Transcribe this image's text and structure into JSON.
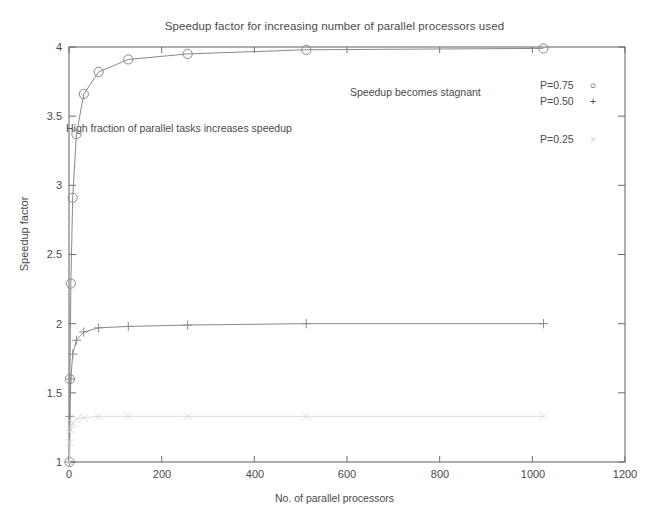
{
  "chart_data": {
    "type": "line",
    "title": "Speedup factor for increasing number of parallel processors used",
    "xlabel": "No. of parallel processors",
    "ylabel": "Speedup factor",
    "xlim": [
      0,
      1200
    ],
    "ylim": [
      1,
      4
    ],
    "xticks": [
      0,
      200,
      400,
      600,
      800,
      1000,
      1200
    ],
    "yticks": [
      1,
      1.5,
      2,
      2.5,
      3,
      3.5,
      4
    ],
    "xtick_labels": [
      "0",
      "200",
      "400",
      "600",
      "800",
      "1000",
      "1200"
    ],
    "ytick_labels": [
      "1",
      "1.5",
      "2",
      "2.5",
      "3",
      "3.5",
      "4"
    ],
    "grid": false,
    "legend_position": "outside-right-top",
    "x": [
      1,
      2,
      4,
      8,
      16,
      32,
      64,
      128,
      256,
      512,
      1024
    ],
    "series": [
      {
        "name": "P=0.75",
        "marker": "circle",
        "color": "#8a8a8a",
        "values": [
          1.0,
          1.6,
          2.29,
          2.91,
          3.37,
          3.66,
          3.82,
          3.91,
          3.95,
          3.98,
          3.99
        ]
      },
      {
        "name": "P=0.50",
        "marker": "plus",
        "color": "#8a8a8a",
        "values": [
          1.0,
          1.33,
          1.6,
          1.78,
          1.88,
          1.94,
          1.97,
          1.98,
          1.99,
          2.0,
          2.0
        ]
      },
      {
        "name": "P=0.25",
        "marker": "x",
        "color": "#d8d8d8",
        "values": [
          1.0,
          1.14,
          1.23,
          1.28,
          1.31,
          1.32,
          1.33,
          1.33,
          1.33,
          1.33,
          1.33
        ]
      }
    ],
    "annotations": [
      {
        "text": "Speedup becomes stagnant",
        "x": 610,
        "y": 3.62
      },
      {
        "text": "High fraction of parallel tasks increases speedup",
        "x": 0,
        "y": 3.45
      }
    ],
    "legend": [
      {
        "label": "P=0.75",
        "marker": "○"
      },
      {
        "label": "P=0.50",
        "marker": "+"
      },
      {
        "label": "P=0.25",
        "marker": "×"
      }
    ]
  }
}
